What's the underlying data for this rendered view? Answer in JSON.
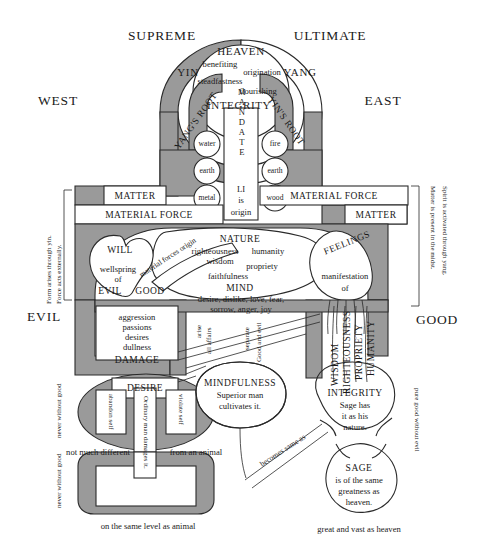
{
  "figure": {
    "title_parts": {
      "supreme": "SUPREME",
      "ultimate": "ULTIMATE"
    },
    "compass": {
      "west": "WEST",
      "east": "EAST"
    },
    "poles": {
      "yin": "YIN",
      "yang": "YANG"
    },
    "roots": {
      "yangs_root": "YANG'S ROOT",
      "yins_root": "YIN'S ROOT"
    },
    "heaven": {
      "title": "HEAVEN",
      "virtues": [
        "benefiting",
        "origination",
        "steadfastness",
        "flourishing"
      ],
      "integrity": "INTEGRITY"
    },
    "mandate": {
      "word": "MANDATE",
      "li": "LI",
      "is": "is",
      "origin": "origin"
    },
    "elements_left": [
      "water",
      "earth",
      "metal"
    ],
    "elements_right": [
      "fire",
      "earth",
      "wood"
    ],
    "boxes": {
      "matter_left": "MATTER",
      "material_force_left": "MATERIAL FORCE",
      "material_force_right": "MATERIAL FORCE",
      "matter_right": "MATTER"
    },
    "margins": {
      "left": "Form arises through yin. Force acts externally.",
      "left_line1": "Form arises through yin.",
      "left_line2": "Force acts externally.",
      "right_line1": "Matter is present in the midst.",
      "right_line2": "Spirit is activated through yang."
    },
    "will": {
      "title": "WILL",
      "wellspring": "wellspring",
      "of": "of",
      "evil": "EVIL",
      "good": "GOOD"
    },
    "material_forces_origin": "material forces origin",
    "nature": {
      "title": "NATURE",
      "virtues": [
        "righteousness",
        "humanity",
        "wisdom",
        "propriety",
        "faithfulness"
      ]
    },
    "mind": {
      "title": "MIND",
      "line1": "desire, dislike, love, fear,",
      "line2": "sorrow, anger, joy"
    },
    "feelings": {
      "title": "FEELINGS",
      "manifestation": "manifestation",
      "of": "of"
    },
    "axis": {
      "evil": "EVIL",
      "good": "GOOD"
    },
    "damage_box": {
      "items": [
        "aggression",
        "passions",
        "desires",
        "dullness"
      ],
      "title": "DAMAGE"
    },
    "middle_vertical": {
      "arise": "arise",
      "all_affairs": "all affairs",
      "separate": "separate",
      "good_and_evil": "Good and evil"
    },
    "four_virtues_vertical": [
      "WISDOM",
      "RIGHTEOUSNESS",
      "PROPRIETY",
      "HUMANITY"
    ],
    "desire": {
      "title": "DESIRE",
      "abandon_self": "abandon self",
      "violate_self": "violate self",
      "ordinary_man": "Ordinary man damages it."
    },
    "mindfulness": {
      "title": "MINDFULNESS",
      "line1": "Superior man",
      "line2": "cultivates it."
    },
    "integrity_sage": {
      "title": "INTEGRITY",
      "line1": "Sage has",
      "line2": "it as his",
      "line3": "nature."
    },
    "sage": {
      "title": "SAGE",
      "line1": "is of the same",
      "line2": "greatness as",
      "line3": "heaven."
    },
    "becomes_same_as": "becomes same as",
    "side_notes": {
      "left_upper": "never without good",
      "left_lower": "never without good",
      "right": "pure good without evil"
    },
    "bottom_notes": {
      "left_mid": "not much different",
      "left_mid_2": "from an animal",
      "left": "on the same level as animal",
      "right": "great and vast as heaven"
    },
    "colors": {
      "shade": "#9a9a9a",
      "shade_dark": "#8c8c8c",
      "line": "#2a2a2a",
      "paper": "#ffffff"
    }
  }
}
